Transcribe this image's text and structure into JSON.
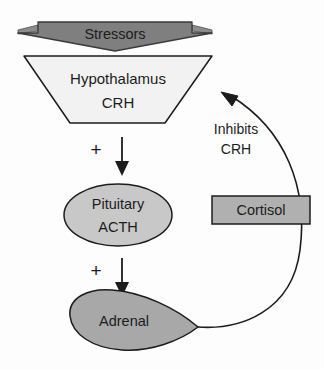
{
  "diagram": {
    "type": "flow-diagram",
    "background_color": "#fdfdfd",
    "stroke_color": "#1c1c1c",
    "nodes": {
      "stressors": {
        "label": "Stressors",
        "shape": "banner-chevron",
        "fill": "#7f7f7f",
        "text_color": "#1c1c1c"
      },
      "hypothalamus": {
        "label_line1": "Hypothalamus",
        "label_line2": "CRH",
        "shape": "inverted-trapezoid",
        "fill": "#f2f2f2",
        "text_color": "#1c1c1c"
      },
      "pituitary": {
        "label_line1": "Pituitary",
        "label_line2": "ACTH",
        "shape": "ellipse",
        "fill": "#c8c8c8",
        "text_color": "#1c1c1c"
      },
      "adrenal": {
        "label": "Adrenal",
        "shape": "teardrop",
        "fill": "#a8a8a8",
        "text_color": "#1c1c1c"
      },
      "cortisol": {
        "label": "Cortisol",
        "shape": "rectangle",
        "fill": "#b0b0b0",
        "text_color": "#1c1c1c"
      }
    },
    "edges": {
      "hypothalamus_to_pituitary": {
        "sign": "+",
        "direction": "down",
        "style": "straight-arrow"
      },
      "pituitary_to_adrenal": {
        "sign": "+",
        "direction": "down",
        "style": "straight-arrow"
      },
      "adrenal_to_hypothalamus": {
        "label_line1": "Inhibits",
        "label_line2": "CRH",
        "direction": "up-left",
        "style": "curved-arrow"
      }
    }
  }
}
